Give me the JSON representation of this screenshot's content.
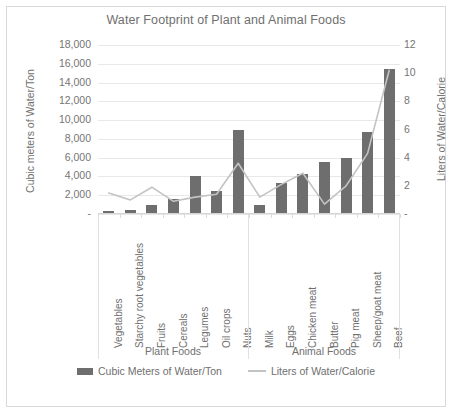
{
  "chart": {
    "title": "Water Footprint of Plant and Animal Foods",
    "legend": {
      "bar_label": "Cubic Meters of Water/Ton",
      "line_label": "Liters of Water/Calorie"
    },
    "groups": [
      {
        "name": "Plant Foods"
      },
      {
        "name": "Animal Foods"
      }
    ]
  },
  "chart_data": {
    "type": "bar",
    "title": "Water Footprint of Plant and Animal Foods",
    "xlabel": "",
    "ylabel": "Cubic meters of Water/Ton",
    "y2label": "Liters of Water/Calorie",
    "ylim": [
      0,
      18000
    ],
    "y2lim": [
      0,
      12
    ],
    "grid": true,
    "legend_position": "bottom",
    "categories": [
      "Vegetables",
      "Starchy root vegetables",
      "Fruits",
      "Cereals",
      "Legumes",
      "Oil crops",
      "Nuts",
      "Milk",
      "Eggs",
      "Chicken meat",
      "Butter",
      "Pig meat",
      "Sheep/goat meat",
      "Beef"
    ],
    "group_spans": [
      {
        "name": "Plant Foods",
        "categories": [
          "Vegetables",
          "Starchy root vegetables",
          "Fruits",
          "Cereals",
          "Legumes",
          "Oil crops",
          "Nuts"
        ]
      },
      {
        "name": "Animal Foods",
        "categories": [
          "Milk",
          "Eggs",
          "Chicken meat",
          "Butter",
          "Pig meat",
          "Sheep/goat meat",
          "Beef"
        ]
      }
    ],
    "series": [
      {
        "name": "Cubic Meters of Water/Ton",
        "type": "bar",
        "axis": "left",
        "color": "#6e6e6e",
        "values": [
          300,
          400,
          1000,
          1600,
          4000,
          2400,
          9000,
          1000,
          3300,
          4300,
          5500,
          6000,
          8700,
          15400
        ]
      },
      {
        "name": "Liters of Water/Calorie",
        "type": "line",
        "axis": "right",
        "color": "#c3c3c3",
        "values": [
          1.5,
          1.0,
          1.9,
          0.9,
          1.2,
          1.4,
          3.6,
          1.2,
          2.1,
          2.9,
          0.7,
          2.0,
          4.3,
          10.2
        ]
      }
    ],
    "y_ticks_left": [
      "18,000",
      "16,000",
      "14,000",
      "12,000",
      "10,000",
      "8,000",
      "6,000",
      "4,000",
      "2,000",
      "-"
    ],
    "y_ticks_right": [
      "12",
      "10",
      "8",
      "6",
      "4",
      "2",
      "-"
    ]
  }
}
